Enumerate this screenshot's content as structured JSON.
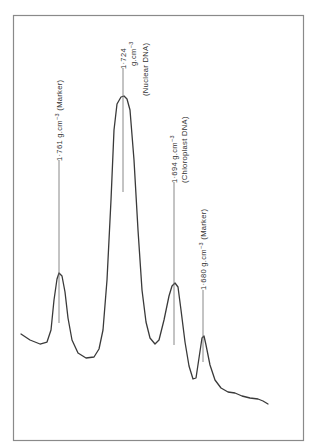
{
  "chart_data": {
    "type": "line",
    "title": "",
    "xlabel": "",
    "ylabel": "",
    "grid": false,
    "legend": null,
    "peaks": [
      {
        "density": "1·761",
        "unit": "g.cm⁻³",
        "note": "(Marker)",
        "relative_height": 0.33
      },
      {
        "density": "1·724",
        "unit": "g.cm⁻³",
        "note": "(Nuclear DNA)",
        "relative_height": 1.0
      },
      {
        "density": "1·694",
        "unit": "g.cm⁻³",
        "note": "(Chloroplast DNA)",
        "relative_height": 0.29
      },
      {
        "density": "1·680",
        "unit": "g.cm⁻³",
        "note": "(Marker)",
        "relative_height": 0.1
      }
    ],
    "trace_points": [
      [
        21,
        334
      ],
      [
        30,
        340
      ],
      [
        40,
        344
      ],
      [
        47,
        342
      ],
      [
        51,
        330
      ],
      [
        54,
        300
      ],
      [
        57,
        279
      ],
      [
        59,
        273
      ],
      [
        62,
        276
      ],
      [
        65,
        292
      ],
      [
        68,
        318
      ],
      [
        72,
        340
      ],
      [
        78,
        353
      ],
      [
        86,
        358
      ],
      [
        94,
        357
      ],
      [
        99,
        349
      ],
      [
        103,
        330
      ],
      [
        107,
        280
      ],
      [
        111,
        200
      ],
      [
        114,
        130
      ],
      [
        117,
        104
      ],
      [
        121,
        97
      ],
      [
        124,
        96
      ],
      [
        127,
        99
      ],
      [
        130,
        110
      ],
      [
        134,
        160
      ],
      [
        138,
        230
      ],
      [
        142,
        290
      ],
      [
        146,
        322
      ],
      [
        150,
        338
      ],
      [
        155,
        344
      ],
      [
        159,
        340
      ],
      [
        164,
        320
      ],
      [
        169,
        296
      ],
      [
        172,
        286
      ],
      [
        175,
        283
      ],
      [
        178,
        287
      ],
      [
        181,
        310
      ],
      [
        185,
        342
      ],
      [
        189,
        366
      ],
      [
        193,
        379
      ],
      [
        196,
        378
      ],
      [
        199,
        358
      ],
      [
        202,
        338
      ],
      [
        204,
        336
      ],
      [
        206,
        345
      ],
      [
        210,
        365
      ],
      [
        215,
        380
      ],
      [
        221,
        388
      ],
      [
        228,
        392
      ],
      [
        235,
        393
      ],
      [
        242,
        396
      ],
      [
        250,
        398
      ],
      [
        258,
        399
      ],
      [
        263,
        401
      ],
      [
        268,
        404
      ]
    ]
  },
  "labels": {
    "marker_1761": {
      "value": "1·761",
      "unit": "g.cm",
      "exp": "−3",
      "note": "(Marker)"
    },
    "nuclear_1724": {
      "value": "1·724",
      "unit": "g.cm",
      "exp": "−3",
      "note": "(Nuclear DNA)"
    },
    "chloroplast_1694": {
      "value": "1·694",
      "unit": "g.cm",
      "exp": "−3",
      "note": "(Chloroplast DNA)"
    },
    "marker_1680": {
      "value": "1·680",
      "unit": "g.cm",
      "exp": "−3",
      "note": "(Marker)"
    }
  },
  "colors": {
    "trace": "#3a3a3a",
    "frame": "#8a8a8a",
    "background": "#ffffff"
  }
}
